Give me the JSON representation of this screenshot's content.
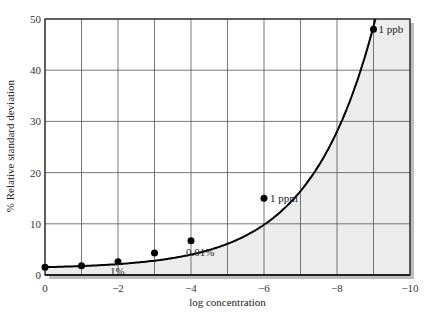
{
  "chart_data": {
    "type": "line",
    "title": "",
    "xlabel": "log concentration",
    "ylabel": "% Relative standard deviation",
    "x": [
      0,
      -1,
      -2,
      -3,
      -4,
      -6,
      -9
    ],
    "series": [
      {
        "name": "RSD curve",
        "values": [
          1.5,
          1.8,
          2.6,
          4.3,
          6.7,
          15,
          48
        ]
      }
    ],
    "annotations": [
      {
        "text": "1%",
        "x": -2,
        "y": 2.6
      },
      {
        "text": "0.01%",
        "x": -4,
        "y": 6.7
      },
      {
        "text": "1 ppm",
        "x": -6,
        "y": 15
      },
      {
        "text": "1 ppb",
        "x": -9,
        "y": 48
      }
    ],
    "xticks": [
      "0",
      "−2",
      "−4",
      "−6",
      "−8",
      "−10"
    ],
    "yticks": [
      "0",
      "10",
      "20",
      "30",
      "40",
      "50"
    ],
    "xlim": [
      0,
      -10
    ],
    "ylim": [
      0,
      50
    ],
    "grid": true,
    "shaded_region": "area under curve lightly shaded",
    "colors": {
      "line": "#000000",
      "shade": "#ececec",
      "grid": "#555555"
    }
  }
}
